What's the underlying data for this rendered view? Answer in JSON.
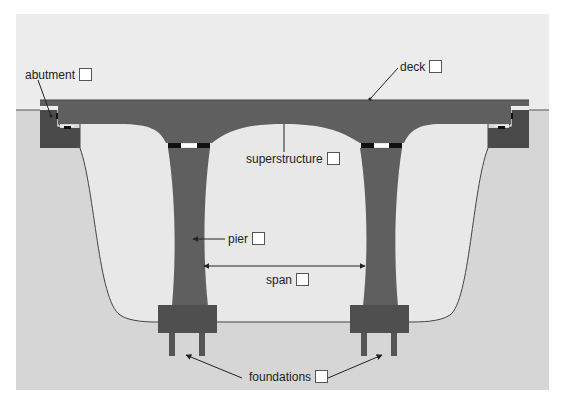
{
  "diagram": {
    "colors": {
      "sky": "#ececec",
      "ground": "#d9d9d9",
      "valley": "#e6e6e6",
      "structure": "#5f5f5f",
      "abutment": "#4a4a4a",
      "footing": "#4f4f4f",
      "bearing": "#1a1a1a",
      "outline": "#333333"
    },
    "labels": [
      {
        "id": "abutment",
        "text": "abutment"
      },
      {
        "id": "deck",
        "text": "deck"
      },
      {
        "id": "superstructure",
        "text": "superstructure"
      },
      {
        "id": "pier",
        "text": "pier"
      },
      {
        "id": "span",
        "text": "span"
      },
      {
        "id": "foundations",
        "text": "foundations"
      }
    ]
  }
}
